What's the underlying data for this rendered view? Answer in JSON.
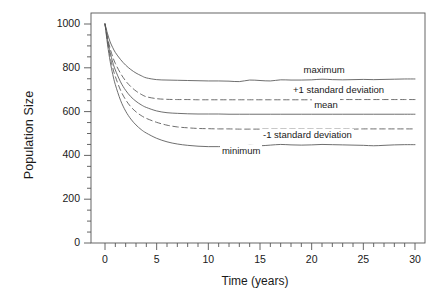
{
  "chart_data": {
    "type": "line",
    "title": "",
    "xlabel": "Time (years)",
    "ylabel": "Population Size",
    "xlim": [
      -0.6,
      31.0
    ],
    "ylim": [
      0,
      1040
    ],
    "xticks": [
      0,
      5,
      10,
      15,
      20,
      25,
      30
    ],
    "yticks": [
      0,
      200,
      400,
      600,
      800,
      1000
    ],
    "xtick_labels": [
      "0",
      "5",
      "10",
      "15",
      "20",
      "25",
      "30"
    ],
    "ytick_labels": [
      "0",
      "200",
      "400",
      "600",
      "800",
      "1000"
    ],
    "x_minor_tick_interval": 1,
    "y_minor_tick_interval": 50,
    "grid": false,
    "legend_position": "inline-annotations",
    "line_color": "#555555",
    "x": [
      0,
      0.25,
      0.5,
      0.75,
      1,
      1.5,
      2,
      2.5,
      3,
      3.5,
      4,
      5,
      6,
      7,
      8,
      9,
      10,
      11,
      12,
      13,
      14,
      15,
      16,
      17,
      18,
      19,
      20,
      21,
      22,
      23,
      24,
      25,
      26,
      27,
      28,
      29,
      30
    ],
    "series": [
      {
        "name": "maximum",
        "style": "solid",
        "asymptote": 750,
        "values": [
          1000,
          955,
          918,
          892,
          870,
          838,
          812,
          792,
          776,
          764,
          754,
          746,
          744,
          743,
          742,
          741,
          740,
          740,
          739,
          737,
          744,
          742,
          740,
          745,
          744,
          744,
          745,
          748,
          746,
          745,
          746,
          747,
          746,
          747,
          748,
          749,
          749
        ]
      },
      {
        "name": "+1 standard deviation",
        "style": "dashed",
        "asymptote": 655,
        "values": [
          1000,
          938,
          888,
          850,
          820,
          775,
          740,
          714,
          694,
          679,
          668,
          659,
          656,
          655,
          655,
          654,
          654,
          654,
          654,
          654,
          654,
          654,
          654,
          654,
          654,
          654,
          654,
          654,
          655,
          655,
          655,
          655,
          655,
          655,
          655,
          655,
          655
        ]
      },
      {
        "name": "mean",
        "style": "solid",
        "asymptote": 588,
        "values": [
          1000,
          928,
          870,
          825,
          790,
          736,
          697,
          668,
          647,
          631,
          619,
          603,
          595,
          592,
          590,
          589,
          589,
          589,
          588,
          588,
          588,
          588,
          588,
          588,
          588,
          588,
          588,
          588,
          588,
          588,
          588,
          588,
          588,
          588,
          588,
          588,
          588
        ]
      },
      {
        "name": "-1 standard deviation",
        "style": "dashed",
        "asymptote": 520,
        "values": [
          1000,
          918,
          851,
          800,
          760,
          698,
          654,
          622,
          599,
          582,
          569,
          551,
          538,
          530,
          526,
          523,
          522,
          521,
          521,
          520,
          520,
          520,
          520,
          520,
          520,
          520,
          520,
          520,
          520,
          520,
          520,
          521,
          521,
          521,
          521,
          521,
          521
        ]
      },
      {
        "name": "minimum",
        "style": "solid",
        "asymptote": 448,
        "values": [
          1000,
          905,
          829,
          770,
          723,
          652,
          602,
          566,
          539,
          518,
          502,
          478,
          462,
          452,
          446,
          442,
          440,
          440,
          441,
          442,
          446,
          444,
          447,
          450,
          448,
          447,
          448,
          450,
          449,
          448,
          447,
          446,
          444,
          446,
          448,
          449,
          449
        ]
      }
    ],
    "annotations": [
      {
        "text": "maximum",
        "x": 21.2,
        "y": 787
      },
      {
        "text": "+1 standard deviation",
        "x": 22.6,
        "y": 692
      },
      {
        "text": "mean",
        "x": 21.4,
        "y": 625
      },
      {
        "text": "-1 standard deviation",
        "x": 19.6,
        "y": 487
      },
      {
        "text": "minimum",
        "x": 13.2,
        "y": 414
      }
    ]
  }
}
